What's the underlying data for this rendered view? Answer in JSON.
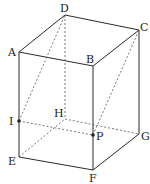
{
  "figure": {
    "type": "rectangular prism (cuboid) with cross-section",
    "vertices": {
      "A": {
        "label": "A",
        "x": 19,
        "y": 52
      },
      "B": {
        "label": "B",
        "x": 93,
        "y": 66
      },
      "C": {
        "label": "C",
        "x": 139,
        "y": 30
      },
      "D": {
        "label": "D",
        "x": 65,
        "y": 15
      },
      "E": {
        "label": "E",
        "x": 19,
        "y": 157
      },
      "F": {
        "label": "F",
        "x": 93,
        "y": 170
      },
      "G": {
        "label": "G",
        "x": 139,
        "y": 134
      },
      "H": {
        "label": "H",
        "x": 65,
        "y": 119
      }
    },
    "points": {
      "I": {
        "label": "I",
        "x": 19,
        "y": 121,
        "on_edge": "AE"
      },
      "P": {
        "label": "P",
        "x": 93,
        "y": 135,
        "on_edge": "BF"
      }
    },
    "solid_edges": [
      "AB",
      "BC",
      "CD",
      "DA",
      "AE",
      "BF",
      "CG",
      "EF",
      "FG"
    ],
    "hidden_edges": [
      "DH",
      "EH",
      "HG"
    ],
    "auxiliary_dashed_lines": [
      "ID",
      "IP",
      "PC"
    ],
    "colors": {
      "line": "#2a2a2a",
      "dashed": "#555555",
      "background": "#ffffff"
    }
  }
}
